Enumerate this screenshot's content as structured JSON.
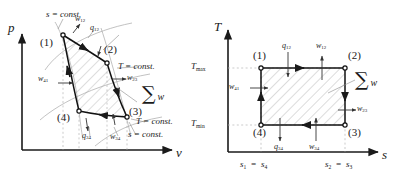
{
  "figure": {
    "kind": "thermodynamics-carnot-cycle",
    "panels": [
      {
        "id": "pv",
        "name": "p-v-diagram",
        "axes": {
          "y_label": "p",
          "x_label": "v"
        },
        "state_points": [
          "(1)",
          "(2)",
          "(3)",
          "(4)"
        ],
        "process_labels": {
          "w12": "w12",
          "w23": "w23",
          "w34": "w34",
          "w41": "w41",
          "q12": "q12",
          "q34": "q34"
        },
        "curve_labels": {
          "s_const_top": "s = const.",
          "s_const_bottom": "s = const.",
          "T_const_upper": "T = const.",
          "T_const_lower": "T = const."
        },
        "area_label": "w",
        "area_symbol": "∑"
      },
      {
        "id": "ts",
        "name": "T-s-diagram",
        "axes": {
          "y_label": "T",
          "x_label": "s"
        },
        "y_ticks": [
          "Tmax",
          "Tmin"
        ],
        "x_ticks": [
          "s1 = s4",
          "s2 = s3"
        ],
        "state_points": [
          "(1)",
          "(2)",
          "(3)",
          "(4)"
        ],
        "process_labels": {
          "w12": "w12",
          "w23": "w23",
          "w34": "w34",
          "w41": "w41",
          "q12": "q12",
          "q34": "q34"
        },
        "area_label": "w",
        "area_symbol": "∑"
      }
    ]
  },
  "text": {
    "p": "p",
    "v": "v",
    "T": "T",
    "s": "s",
    "pt1": "(1)",
    "pt2": "(2)",
    "pt3": "(3)",
    "pt4": "(4)",
    "s_const": "s = const.",
    "T_const": "T = const.",
    "sigma": "∑",
    "w": "w",
    "w12_base": "w",
    "w12_sub": "12",
    "w23_sub": "23",
    "w34_sub": "34",
    "w41_sub": "41",
    "q_base": "q",
    "q12_sub": "12",
    "q34_sub": "34",
    "Tmax_base": "T",
    "Tmax_sub": "max",
    "Tmin_sub": "min",
    "s1_base": "s",
    "s1_sub": "1",
    "eq": "=",
    "s4_sub": "4",
    "s2_sub": "2",
    "s3_sub": "3"
  },
  "colors": {
    "ink": "#1a1a1a",
    "cycle": "#111111",
    "hatch": "#9a9a9a",
    "leader": "#8c8c8c",
    "dashed": "#b4b4b4",
    "curve_light": "#a8a8a8"
  }
}
